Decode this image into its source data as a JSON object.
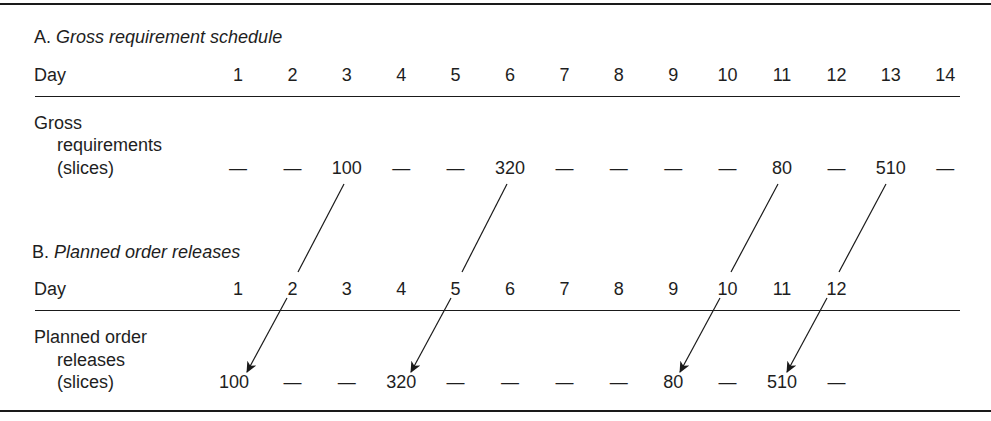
{
  "section_a": {
    "prefix": "A.",
    "title": "Gross requirement schedule",
    "day_label": "Day",
    "days": [
      "1",
      "2",
      "3",
      "4",
      "5",
      "6",
      "7",
      "8",
      "9",
      "10",
      "11",
      "12",
      "13",
      "14"
    ],
    "row_label_line1": "Gross",
    "row_label_line2": "requirements",
    "row_label_line3": "(slices)",
    "values": [
      "—",
      "—",
      "100",
      "—",
      "—",
      "320",
      "—",
      "—",
      "—",
      "—",
      "80",
      "—",
      "510",
      "—"
    ]
  },
  "section_b": {
    "prefix": "B.",
    "title": "Planned order releases",
    "day_label": "Day",
    "days": [
      "1",
      "2",
      "3",
      "4",
      "5",
      "6",
      "7",
      "8",
      "9",
      "10",
      "11",
      "12"
    ],
    "row_label_line1": "Planned order",
    "row_label_line2": "releases",
    "row_label_line3": "(slices)",
    "values": [
      "100",
      "—",
      "—",
      "320",
      "—",
      "—",
      "—",
      "—",
      "80",
      "—",
      "510",
      "—"
    ]
  },
  "arrows": [
    {
      "from_day": 3,
      "to_day": 1,
      "quantity": "100"
    },
    {
      "from_day": 6,
      "to_day": 4,
      "quantity": "320"
    },
    {
      "from_day": 11,
      "to_day": 9,
      "quantity": "80"
    },
    {
      "from_day": 13,
      "to_day": 11,
      "quantity": "510"
    }
  ],
  "lead_time_days": 2
}
